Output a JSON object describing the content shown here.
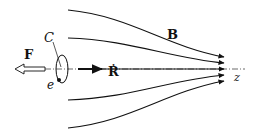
{
  "diagram": {
    "labels": {
      "force": "F",
      "loop": "C",
      "charge": "e",
      "velocity": "Ṙ",
      "field": "B",
      "axis": "z"
    },
    "colors": {
      "stroke": "#111111",
      "background": "#ffffff"
    }
  }
}
